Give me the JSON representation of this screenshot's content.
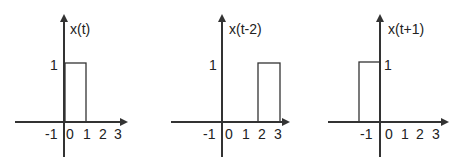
{
  "panels": [
    {
      "label": "x(t)",
      "origin_x": 64,
      "pulse": {
        "start": 0,
        "end": 1,
        "height": 1
      },
      "height_label": "1",
      "height_label_side": "left",
      "ticks": [
        "-1",
        "0",
        "1",
        "2",
        "3"
      ]
    },
    {
      "label": "x(t-2)",
      "origin_x": 222,
      "pulse": {
        "start": 2,
        "end": 3,
        "height": 1
      },
      "height_label": "1",
      "height_label_side": "left",
      "ticks": [
        "-1",
        "0",
        "1",
        "2",
        "3"
      ]
    },
    {
      "label": "x(t+1)",
      "origin_x": 380,
      "pulse": {
        "start": -1,
        "end": 0,
        "height": 1
      },
      "height_label": "1",
      "height_label_side": "right",
      "ticks": [
        "-1",
        "0",
        "1",
        "2",
        "3"
      ]
    }
  ],
  "colors": {
    "line": "#333333",
    "text": "#222222"
  }
}
